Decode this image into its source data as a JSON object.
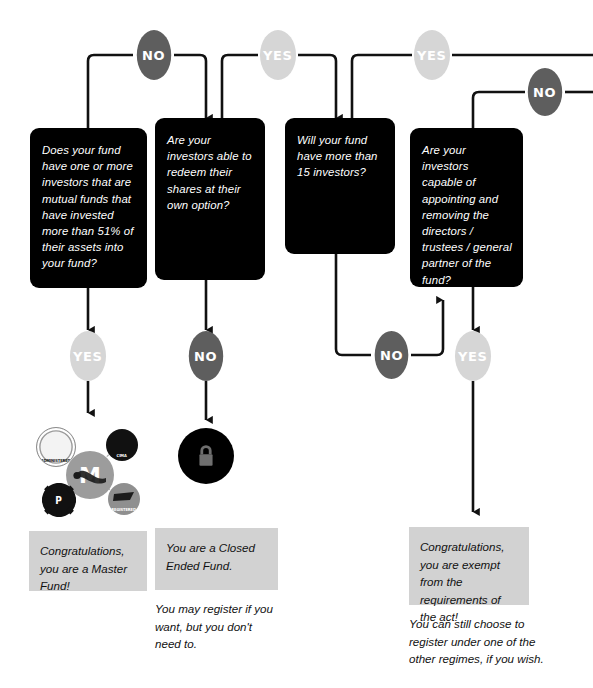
{
  "colors": {
    "question_box_bg": "#000000",
    "question_text": "#ffffff",
    "yes_circle": "#d6d6d6",
    "no_circle": "#5e5e5e",
    "result_box_bg": "#d2d2d2",
    "result_text": "#111111",
    "wire": "#111111",
    "hub_center": "#9c9c9c",
    "page_bg": "#ffffff"
  },
  "questions": [
    {
      "id": "q1",
      "text": "Does your fund have one or more investors that are mutual funds that have invested more than 51% of their assets into your fund?"
    },
    {
      "id": "q2",
      "text": "Are your investors able to redeem their shares at their own option?"
    },
    {
      "id": "q3",
      "text": "Will your fund have more than 15 investors?"
    },
    {
      "id": "q4",
      "text": "Are your investors capable of appointing and removing the directors / trustees / general partner of the fund?"
    }
  ],
  "branch_labels": {
    "top_no": "NO",
    "top_yes_mid": "YES",
    "top_yes_right": "YES",
    "top_no_right": "NO",
    "q1_yes": "YES",
    "q2_no": "NO",
    "q3_no": "NO",
    "q4_yes": "YES"
  },
  "outcomes": [
    {
      "id": "master-fund",
      "text": "Congratulations, you are a Master Fund!",
      "note": ""
    },
    {
      "id": "closed-ended-fund",
      "text": "You are a Closed Ended Fund.",
      "note": "You may register if you want, but you don't need to."
    },
    {
      "id": "exempt",
      "text": "Congratulations, you are exempt from the requirements of the act!",
      "note": "You can still choose to register under one of the other regimes, if you wish."
    }
  ],
  "icons": {
    "master_hub_center": "M",
    "master_hub_satellites": [
      {
        "name": "administered-icon",
        "label": "ADMINISTERED"
      },
      {
        "name": "cima-icon",
        "label": "CIMA"
      },
      {
        "name": "licensed-icon",
        "label": "P"
      },
      {
        "name": "portfolio-icon",
        "label": "REGISTERED"
      }
    ],
    "closed_ended": "lock-icon"
  }
}
